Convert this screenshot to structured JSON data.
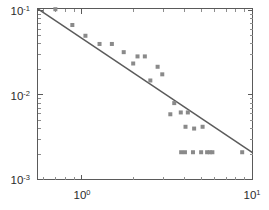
{
  "chart_data": {
    "type": "scatter",
    "title": "",
    "subtitle": "",
    "xlabel": "",
    "ylabel": "",
    "xscale": "log",
    "yscale": "log",
    "xlim": [
      0.55,
      10.0
    ],
    "ylim": [
      0.001,
      0.105
    ],
    "grid": false,
    "legend": null,
    "legend_position": "none",
    "x_tick_labels": [
      "10^0",
      "10^1"
    ],
    "x_tick_values": [
      1,
      10
    ],
    "x_tick_mantissas": [
      "10",
      "10"
    ],
    "x_tick_exponents": [
      "0",
      "1"
    ],
    "y_tick_labels": [
      "10^-1",
      "10^-2",
      "10^-3"
    ],
    "y_tick_values": [
      0.1,
      0.01,
      0.001
    ],
    "y_tick_mantissas": [
      "10",
      "10",
      "10"
    ],
    "y_tick_exponents": [
      "-1",
      "-2",
      "-3"
    ],
    "marker_color": "#8a8a8a",
    "marker_shape": "square",
    "marker_size": 4,
    "line_color": "#5b5b5b",
    "axis_color": "#5a5a5a",
    "series": [
      {
        "name": "data",
        "type": "scatter",
        "points": [
          [
            0.7,
            0.103
          ],
          [
            0.88,
            0.067
          ],
          [
            1.05,
            0.05
          ],
          [
            1.27,
            0.04
          ],
          [
            1.5,
            0.04
          ],
          [
            1.76,
            0.032
          ],
          [
            2.0,
            0.0235
          ],
          [
            2.12,
            0.0285
          ],
          [
            2.34,
            0.0285
          ],
          [
            2.52,
            0.0148
          ],
          [
            2.78,
            0.0215
          ],
          [
            2.96,
            0.0175
          ],
          [
            3.3,
            0.0059
          ],
          [
            3.48,
            0.008
          ],
          [
            3.8,
            0.0062
          ],
          [
            4.05,
            0.0042
          ],
          [
            4.18,
            0.0062
          ],
          [
            4.55,
            0.004
          ],
          [
            5.1,
            0.0042
          ],
          [
            3.82,
            0.0021
          ],
          [
            4.02,
            0.0021
          ],
          [
            4.48,
            0.0021
          ],
          [
            5.0,
            0.0021
          ],
          [
            5.42,
            0.0021
          ],
          [
            5.62,
            0.0021
          ],
          [
            5.82,
            0.0021
          ],
          [
            8.7,
            0.0021
          ]
        ]
      },
      {
        "name": "power-law fit",
        "type": "line",
        "points": [
          [
            0.55,
            0.1045
          ],
          [
            10.0,
            0.00208
          ]
        ],
        "slope_loglog": -1.35
      }
    ]
  }
}
